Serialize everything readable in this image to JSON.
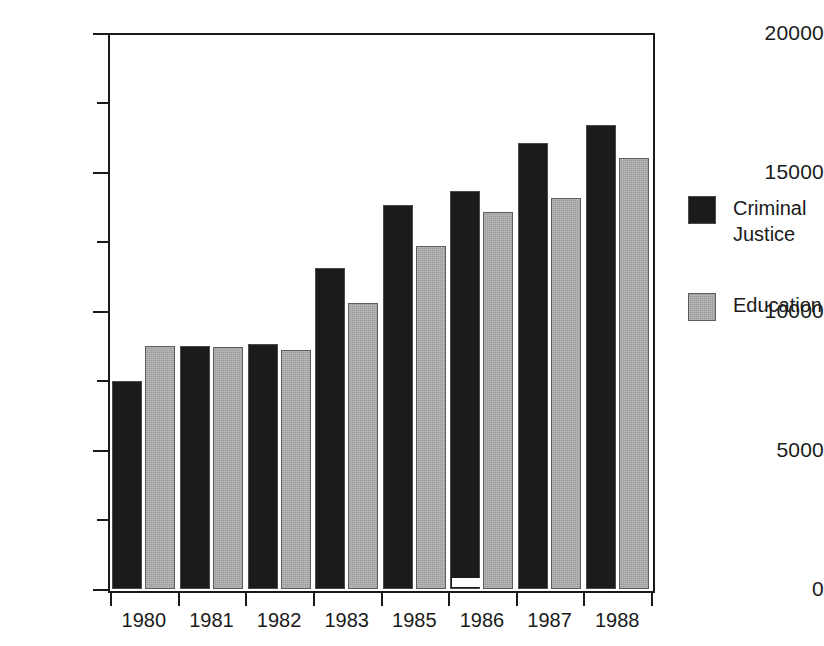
{
  "chart_data": {
    "type": "bar",
    "title": "",
    "subtitle": "",
    "xlabel": "",
    "ylabel": "",
    "categories": [
      "1980",
      "1981",
      "1982",
      "1983",
      "1985",
      "1986",
      "1987",
      "1988"
    ],
    "series": [
      {
        "name": "Criminal Justice",
        "color": "#1b1b1b",
        "values": [
          7500,
          8750,
          8800,
          11550,
          13800,
          14300,
          16050,
          16700
        ]
      },
      {
        "name": "Education",
        "color": "#9c9c9c",
        "values": [
          8750,
          8700,
          8600,
          10300,
          12350,
          13550,
          14050,
          15500
        ]
      }
    ],
    "ylim": [
      0,
      20000
    ],
    "y_major_ticks": [
      0,
      5000,
      10000,
      15000,
      20000
    ],
    "y_minor_ticks": [
      2500,
      7500,
      12500,
      17500
    ],
    "y_tick_labels": [
      "0",
      "5000",
      "10000",
      "15000",
      "20000"
    ],
    "grid": false,
    "legend_position": "right"
  },
  "legend": {
    "items": [
      {
        "label": "Criminal\nJustice",
        "swatch": "dark-swatch"
      },
      {
        "label": "Education",
        "swatch": "gray-swatch"
      }
    ]
  },
  "axes": {
    "y_labels": [
      "20000",
      "15000",
      "10000",
      "5000",
      "0"
    ],
    "x_labels": [
      "1980",
      "1981",
      "1982",
      "1983",
      "1985",
      "1986",
      "1987",
      "1988"
    ]
  }
}
